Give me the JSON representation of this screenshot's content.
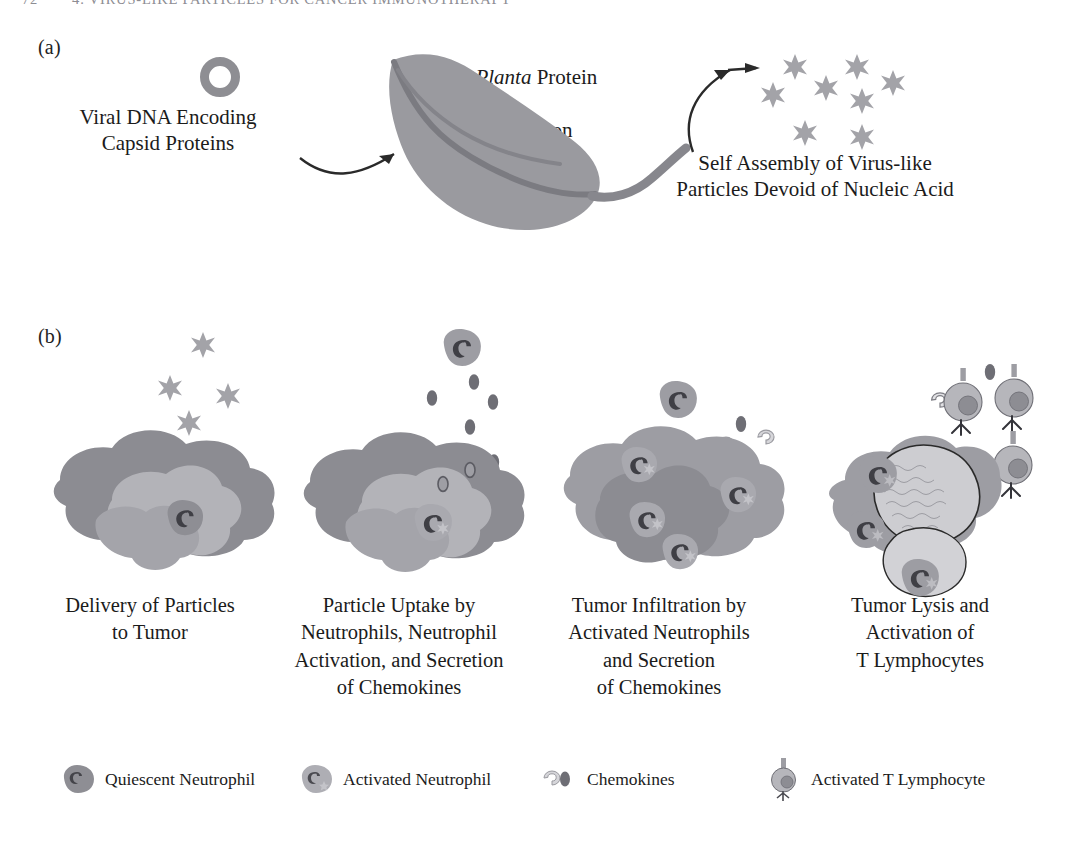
{
  "figure": {
    "running_head": "4. VIRUS-LIKE PARTICLES FOR CANCER IMMUNOTHERAPY",
    "page_number": "72"
  },
  "colors": {
    "particle_star": "#a3a3a8",
    "leaf_body": "#9a9a9f",
    "leaf_vein": "#7c7c82",
    "tumor_dark": "#8c8c92",
    "tumor_mid": "#9d9da3",
    "tumor_light": "#b6b6bb",
    "neutrophil_quiescent": "#8e8e94",
    "neutrophil_activated": "#a9a9af",
    "nucleus_dark": "#4a4a50",
    "chemokine_dark": "#6e6e75",
    "chemokine_light": "#d2d2d6",
    "lymphocyte_body": "#b4b4ba",
    "lymphocyte_nucleus": "#8d8d93",
    "lysed_tumor": "#c9c9cd",
    "outline": "#2a2a2a",
    "text": "#1b1b1b"
  },
  "panel_a": {
    "letter": "(a)",
    "plasmid_label_line1": "Viral DNA Encoding",
    "plasmid_label_line2": "Capsid Proteins",
    "plasmid_label": "Viral DNA Encoding\nCapsid Proteins",
    "translation_label_italic": "In Planta",
    "translation_label_rest": " Protein",
    "translation_label_line2": "Translation",
    "assembly_label": "Self Assembly of Virus-like\nParticles Devoid of Nucleic Acid",
    "icons": {
      "plasmid": "dna-ring-icon",
      "leaf": "tobacco-leaf-icon",
      "arrow_left": "curved-arrow-icon",
      "arrow_right": "curved-arrow-icon",
      "particle": "six-point-star-icon"
    },
    "particle_count": 8
  },
  "panel_b": {
    "letter": "(b)",
    "steps": [
      {
        "index": 1,
        "caption": "Delivery of Particles\nto Tumor",
        "free_particles": 4,
        "neutrophils_quiescent": 1,
        "neutrophils_activated": 0,
        "chemokines": 0,
        "lymphocytes": 0
      },
      {
        "index": 2,
        "caption": "Particle Uptake by\nNeutrophils, Neutrophil\nActivation, and Secretion\nof Chemokines",
        "free_particles": 0,
        "neutrophils_quiescent": 1,
        "neutrophils_activated": 1,
        "chemokines": 6,
        "lymphocytes": 0
      },
      {
        "index": 3,
        "caption": "Tumor Infiltration by\nActivated Neutrophils\nand Secretion\nof Chemokines",
        "free_particles": 0,
        "neutrophils_quiescent": 1,
        "neutrophils_activated": 4,
        "chemokines": 5,
        "lymphocytes": 0
      },
      {
        "index": 4,
        "caption": "Tumor Lysis and\nActivation of\nT Lymphocytes",
        "free_particles": 0,
        "neutrophils_quiescent": 0,
        "neutrophils_activated": 3,
        "chemokines": 2,
        "lymphocytes": 3
      }
    ]
  },
  "legend": {
    "items": [
      {
        "icon": "quiescent-neutrophil-icon",
        "label": "Quiescent Neutrophil"
      },
      {
        "icon": "activated-neutrophil-icon",
        "label": "Activated Neutrophil"
      },
      {
        "icon": "chemokine-icon",
        "label": "Chemokines"
      },
      {
        "icon": "activated-t-lymphocyte-icon",
        "label": "Activated T Lymphocyte"
      }
    ]
  }
}
